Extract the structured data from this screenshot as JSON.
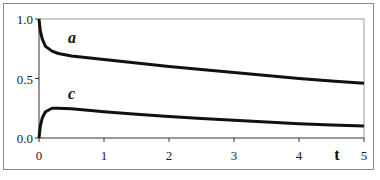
{
  "chart_data": {
    "type": "line",
    "title": "",
    "xlabel": "t",
    "ylabel": "",
    "xlim": [
      0,
      5
    ],
    "ylim": [
      0,
      1
    ],
    "grid": false,
    "legend": "inline labels",
    "x_ticks": [
      "0",
      "1",
      "2",
      "3",
      "4",
      "5"
    ],
    "y_ticks": [
      "0.0",
      "0.5",
      "1.0"
    ],
    "series": [
      {
        "name": "a",
        "x": [
          0,
          0.02,
          0.05,
          0.1,
          0.2,
          0.3,
          0.5,
          1,
          1.5,
          2,
          2.5,
          3,
          3.5,
          4,
          4.5,
          5
        ],
        "values": [
          1.0,
          0.9,
          0.83,
          0.77,
          0.73,
          0.71,
          0.69,
          0.66,
          0.63,
          0.6,
          0.575,
          0.55,
          0.525,
          0.5,
          0.48,
          0.46
        ]
      },
      {
        "name": "c",
        "x": [
          0,
          0.02,
          0.05,
          0.1,
          0.2,
          0.3,
          0.5,
          1,
          1.5,
          2,
          2.5,
          3,
          3.5,
          4,
          4.5,
          5
        ],
        "values": [
          0.0,
          0.1,
          0.17,
          0.22,
          0.25,
          0.25,
          0.245,
          0.22,
          0.2,
          0.18,
          0.165,
          0.15,
          0.135,
          0.12,
          0.11,
          0.1
        ]
      }
    ]
  }
}
